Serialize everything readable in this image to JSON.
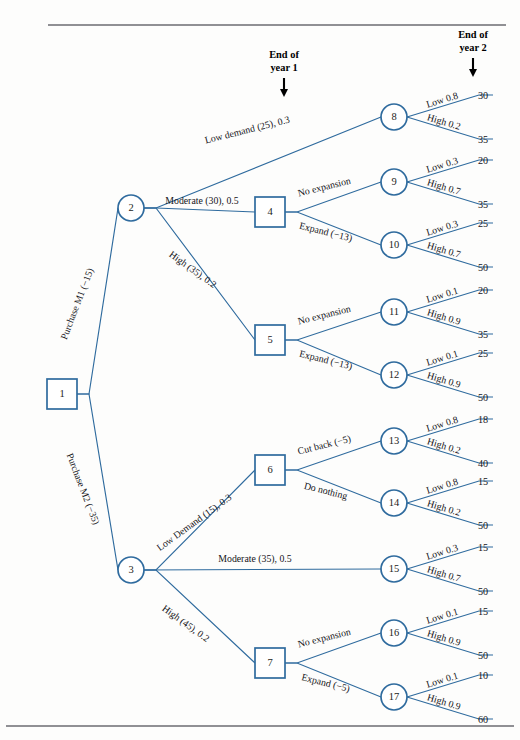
{
  "diagram": {
    "accent_color": "#2f6b9e",
    "rule_color": "#6b6b72",
    "text_color": "#15151a"
  },
  "markers": [
    {
      "id": "end-of-year-1",
      "line1": "End of",
      "line2": "year 1",
      "x": 284,
      "y": 58
    },
    {
      "id": "end-of-year-2",
      "line1": "End of",
      "line2": "year 2",
      "x": 473,
      "y": 38
    }
  ],
  "nodes": [
    {
      "id": "1",
      "label": "1",
      "shape": "square",
      "x": 62,
      "y": 394
    },
    {
      "id": "2",
      "label": "2",
      "shape": "circle",
      "x": 131,
      "y": 208
    },
    {
      "id": "3",
      "label": "3",
      "shape": "circle",
      "x": 131,
      "y": 570
    },
    {
      "id": "4",
      "label": "4",
      "shape": "square",
      "x": 270,
      "y": 212
    },
    {
      "id": "5",
      "label": "5",
      "shape": "square",
      "x": 270,
      "y": 340
    },
    {
      "id": "6",
      "label": "6",
      "shape": "square",
      "x": 270,
      "y": 470
    },
    {
      "id": "7",
      "label": "7",
      "shape": "square",
      "x": 270,
      "y": 663
    },
    {
      "id": "8",
      "label": "8",
      "shape": "circle",
      "x": 394,
      "y": 117
    },
    {
      "id": "9",
      "label": "9",
      "shape": "circle",
      "x": 394,
      "y": 182
    },
    {
      "id": "10",
      "label": "10",
      "shape": "circle",
      "x": 394,
      "y": 245
    },
    {
      "id": "11",
      "label": "11",
      "shape": "circle",
      "x": 394,
      "y": 312
    },
    {
      "id": "12",
      "label": "12",
      "shape": "circle",
      "x": 394,
      "y": 375
    },
    {
      "id": "13",
      "label": "13",
      "shape": "circle",
      "x": 394,
      "y": 441
    },
    {
      "id": "14",
      "label": "14",
      "shape": "circle",
      "x": 394,
      "y": 503
    },
    {
      "id": "15",
      "label": "15",
      "shape": "circle",
      "x": 394,
      "y": 569
    },
    {
      "id": "16",
      "label": "16",
      "shape": "circle",
      "x": 394,
      "y": 633
    },
    {
      "id": "17",
      "label": "17",
      "shape": "circle",
      "x": 394,
      "y": 697
    }
  ],
  "edges": [
    {
      "id": "e1-2",
      "from": "1",
      "to": "2",
      "label": "Purchase M1 (−15)",
      "label_x": 80,
      "label_y": 305,
      "rotate": -69,
      "anchor": "middle"
    },
    {
      "id": "e1-3",
      "from": "1",
      "to": "3",
      "label": "Purchase M2 (−35)",
      "label_x": 80,
      "label_y": 490,
      "rotate": 69,
      "anchor": "middle"
    },
    {
      "id": "e2-8",
      "from": "2",
      "to": "8",
      "label": "Low demand (25), 0.3",
      "label_x": 248,
      "label_y": 133,
      "rotate": -14,
      "anchor": "middle"
    },
    {
      "id": "e2-4",
      "from": "2",
      "to": "4",
      "label": "Moderate (30), 0.5",
      "label_x": 202,
      "label_y": 204,
      "rotate": 0,
      "anchor": "middle"
    },
    {
      "id": "e2-5",
      "from": "2",
      "to": "5",
      "label": "High (35), 0.2",
      "label_x": 191,
      "label_y": 272,
      "rotate": 36,
      "anchor": "middle"
    },
    {
      "id": "e4-9",
      "from": "4",
      "to": "9",
      "label": "No expansion",
      "label_x": 325,
      "label_y": 190,
      "rotate": -14,
      "anchor": "middle"
    },
    {
      "id": "e4-10",
      "from": "4",
      "to": "10",
      "label": "Expand (−13)",
      "label_x": 325,
      "label_y": 235,
      "rotate": 14,
      "anchor": "middle"
    },
    {
      "id": "e5-11",
      "from": "5",
      "to": "11",
      "label": "No expansion",
      "label_x": 325,
      "label_y": 318,
      "rotate": -14,
      "anchor": "middle"
    },
    {
      "id": "e5-12",
      "from": "5",
      "to": "12",
      "label": "Expand (−13)",
      "label_x": 325,
      "label_y": 363,
      "rotate": 14,
      "anchor": "middle"
    },
    {
      "id": "e3-6",
      "from": "3",
      "to": "6",
      "label": "Low Demand (15), 0.3",
      "label_x": 196,
      "label_y": 525,
      "rotate": -36,
      "anchor": "middle"
    },
    {
      "id": "e3-15",
      "from": "3",
      "to": "15",
      "label": "Moderate (35), 0.5",
      "label_x": 255,
      "label_y": 562,
      "rotate": 0,
      "anchor": "middle"
    },
    {
      "id": "e3-7",
      "from": "3",
      "to": "7",
      "label": "High (45), 0.2",
      "label_x": 184,
      "label_y": 626,
      "rotate": 36,
      "anchor": "middle"
    },
    {
      "id": "e6-13",
      "from": "6",
      "to": "13",
      "label": "Cut back (−5)",
      "label_x": 325,
      "label_y": 448,
      "rotate": -14,
      "anchor": "middle"
    },
    {
      "id": "e6-14",
      "from": "6",
      "to": "14",
      "label": "Do nothing",
      "label_x": 325,
      "label_y": 494,
      "rotate": 14,
      "anchor": "middle"
    },
    {
      "id": "e7-16",
      "from": "7",
      "to": "16",
      "label": "No expansion",
      "label_x": 325,
      "label_y": 641,
      "rotate": -14,
      "anchor": "middle"
    },
    {
      "id": "e7-17",
      "from": "7",
      "to": "17",
      "label": "Expand (−5)",
      "label_x": 325,
      "label_y": 686,
      "rotate": 14,
      "anchor": "middle"
    }
  ],
  "leaves": [
    {
      "id": "L8a",
      "from": "8",
      "branch_label": "Low 0.8",
      "value": "30",
      "dir": "up",
      "label_rotate": -17
    },
    {
      "id": "L8b",
      "from": "8",
      "branch_label": "High 0.2",
      "value": "35",
      "dir": "down",
      "label_rotate": 17
    },
    {
      "id": "L9a",
      "from": "9",
      "branch_label": "Low 0.3",
      "value": "20",
      "dir": "up",
      "label_rotate": -17
    },
    {
      "id": "L9b",
      "from": "9",
      "branch_label": "High 0.7",
      "value": "35",
      "dir": "down",
      "label_rotate": 17
    },
    {
      "id": "L10a",
      "from": "10",
      "branch_label": "Low 0.3",
      "value": "25",
      "dir": "up",
      "label_rotate": -17
    },
    {
      "id": "L10b",
      "from": "10",
      "branch_label": "High 0.7",
      "value": "50",
      "dir": "down",
      "label_rotate": 17
    },
    {
      "id": "L11a",
      "from": "11",
      "branch_label": "Low 0.1",
      "value": "20",
      "dir": "up",
      "label_rotate": -17
    },
    {
      "id": "L11b",
      "from": "11",
      "branch_label": "High 0.9",
      "value": "35",
      "dir": "down",
      "label_rotate": 17
    },
    {
      "id": "L12a",
      "from": "12",
      "branch_label": "Low 0.1",
      "value": "25",
      "dir": "up",
      "label_rotate": -17
    },
    {
      "id": "L12b",
      "from": "12",
      "branch_label": "High 0.9",
      "value": "50",
      "dir": "down",
      "label_rotate": 17
    },
    {
      "id": "L13a",
      "from": "13",
      "branch_label": "Low 0.8",
      "value": "18",
      "dir": "up",
      "label_rotate": -17
    },
    {
      "id": "L13b",
      "from": "13",
      "branch_label": "High 0.2",
      "value": "40",
      "dir": "down",
      "label_rotate": 17
    },
    {
      "id": "L14a",
      "from": "14",
      "branch_label": "Low 0.8",
      "value": "15",
      "dir": "up",
      "label_rotate": -17
    },
    {
      "id": "L14b",
      "from": "14",
      "branch_label": "High 0.2",
      "value": "50",
      "dir": "down",
      "label_rotate": 17
    },
    {
      "id": "L15a",
      "from": "15",
      "branch_label": "Low 0.3",
      "value": "15",
      "dir": "up",
      "label_rotate": -17
    },
    {
      "id": "L15b",
      "from": "15",
      "branch_label": "High 0.7",
      "value": "50",
      "dir": "down",
      "label_rotate": 17
    },
    {
      "id": "L16a",
      "from": "16",
      "branch_label": "Low 0.1",
      "value": "15",
      "dir": "up",
      "label_rotate": -17
    },
    {
      "id": "L16b",
      "from": "16",
      "branch_label": "High 0.9",
      "value": "50",
      "dir": "down",
      "label_rotate": 17
    },
    {
      "id": "L17a",
      "from": "17",
      "branch_label": "Low 0.1",
      "value": "10",
      "dir": "up",
      "label_rotate": -17
    },
    {
      "id": "L17b",
      "from": "17",
      "branch_label": "High 0.9",
      "value": "60",
      "dir": "down",
      "label_rotate": 17
    }
  ],
  "rules": [
    {
      "id": "rule-top",
      "x1": 48,
      "y1": 25,
      "x2": 506,
      "y2": 25
    },
    {
      "id": "rule-bottom",
      "x1": 6,
      "y1": 726,
      "x2": 514,
      "y2": 726
    }
  ]
}
